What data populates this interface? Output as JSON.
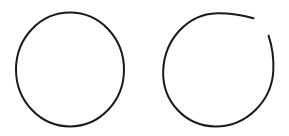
{
  "canvas": {
    "width": 289,
    "height": 136,
    "background_color": "#ffffff",
    "description": "Two hand-drawn black circle outlines side by side on a white background"
  },
  "style": {
    "stroke_color": "#1a1a1a",
    "stroke_width": 2,
    "fill": "none",
    "line_cap": "round"
  },
  "shapes": [
    {
      "id": "closed-circle",
      "label": "Closed circle",
      "type": "circle",
      "closed": true,
      "center_x": 70,
      "center_y": 69.5,
      "radius_x": 54,
      "radius_y": 57,
      "bounds": {
        "left": 16,
        "top": 13,
        "right": 124,
        "bottom": 126
      },
      "stroke_width": 2,
      "stroke_color": "#1a1a1a",
      "path": "M 70 12.5 C 99.8 12.5 124 38.0 124 69.5 C 124 101.0 99.8 126.5 70 126.5 C 40.2 126.5 16 101.0 16 69.5 C 16 38.0 40.2 12.5 70 12.5 Z"
    },
    {
      "id": "open-circle",
      "label": "Open circle with gap at upper right",
      "type": "arc",
      "closed": false,
      "center_x": 218,
      "center_y": 70,
      "radius_x": 55,
      "radius_y": 57,
      "bounds": {
        "left": 163,
        "top": 13,
        "right": 274,
        "bottom": 126
      },
      "gap": {
        "position": "upper-right",
        "start_point_x": 253,
        "start_point_y": 19,
        "end_point_x": 269,
        "end_point_y": 36,
        "start_angle_deg": -47,
        "end_angle_deg": -31,
        "span_deg": 16
      },
      "stroke_width": 2,
      "stroke_color": "#1a1a1a",
      "path": "M 253.5 18.2 C 241.0 14.8 228.5 13.0 217.0 13.2 C 187.5 14.0 164.5 39.5 163.2 70.5 C 162.0 101.5 185.5 126.3 215.5 126.5 C 245.5 126.7 271.5 102.0 273.3 71.0 C 273.9 60.0 272.3 47.0 268.6 35.6"
    }
  ],
  "shape_count": 2
}
